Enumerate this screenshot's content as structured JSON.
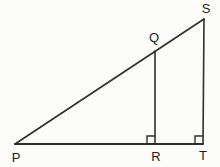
{
  "diagram": {
    "background_color": "#fcfcfb",
    "stroke_color": "#2e2e2e",
    "label_color": "#1c1c1c",
    "width": 220,
    "height": 167,
    "points": {
      "P": {
        "x": 15,
        "y": 144
      },
      "Q": {
        "x": 155,
        "y": 51
      },
      "R": {
        "x": 155,
        "y": 144
      },
      "S": {
        "x": 204,
        "y": 19
      },
      "T": {
        "x": 203,
        "y": 144
      }
    },
    "segments": [
      {
        "from": "P",
        "to": "T",
        "width": 2
      },
      {
        "from": "P",
        "to": "S",
        "width": 1.6
      },
      {
        "from": "S",
        "to": "T",
        "width": 1.6
      },
      {
        "from": "Q",
        "to": "R",
        "width": 1.6
      }
    ],
    "right_angle_marks": [
      {
        "at": "R",
        "size": 8
      },
      {
        "at": "T",
        "size": 8
      }
    ],
    "labels": [
      {
        "text": "P",
        "x": 16,
        "y": 162
      },
      {
        "text": "Q",
        "x": 154,
        "y": 42
      },
      {
        "text": "R",
        "x": 156,
        "y": 161
      },
      {
        "text": "S",
        "x": 206,
        "y": 13
      },
      {
        "text": "T",
        "x": 203,
        "y": 160
      }
    ]
  }
}
